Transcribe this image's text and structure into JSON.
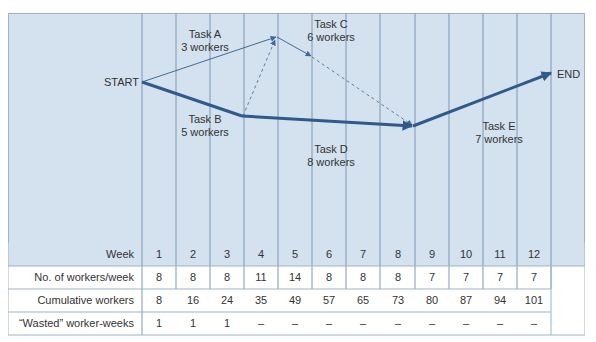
{
  "diagram": {
    "nodes": {
      "start": "START",
      "end": "END"
    },
    "tasks": [
      {
        "name": "Task A",
        "workers": "3 workers"
      },
      {
        "name": "Task B",
        "workers": "5 workers"
      },
      {
        "name": "Task C",
        "workers": "6 workers"
      },
      {
        "name": "Task D",
        "workers": "8 workers"
      },
      {
        "name": "Task E",
        "workers": "7 workers"
      }
    ],
    "colors": {
      "chart_bg": "#d4e1ee",
      "grid_line": "#7f98b3",
      "critical_path": "#2f5a8a",
      "thin_path": "#3f6a97",
      "dashed_path": "#5a7fa6",
      "header_row_bg": "#d4e1ee"
    }
  },
  "table": {
    "week_label": "Week",
    "weeks": [
      "1",
      "2",
      "3",
      "4",
      "5",
      "6",
      "7",
      "8",
      "9",
      "10",
      "11",
      "12"
    ],
    "rows": [
      {
        "label": "No. of workers/week",
        "values": [
          "8",
          "8",
          "8",
          "11",
          "14",
          "8",
          "8",
          "8",
          "7",
          "7",
          "7",
          "7"
        ]
      },
      {
        "label": "Cumulative workers",
        "values": [
          "8",
          "16",
          "24",
          "35",
          "49",
          "57",
          "65",
          "73",
          "80",
          "87",
          "94",
          "101"
        ]
      },
      {
        "label": "“Wasted” worker-weeks",
        "values": [
          "1",
          "1",
          "1",
          "–",
          "–",
          "–",
          "–",
          "–",
          "–",
          "–",
          "–",
          "–"
        ]
      }
    ]
  }
}
